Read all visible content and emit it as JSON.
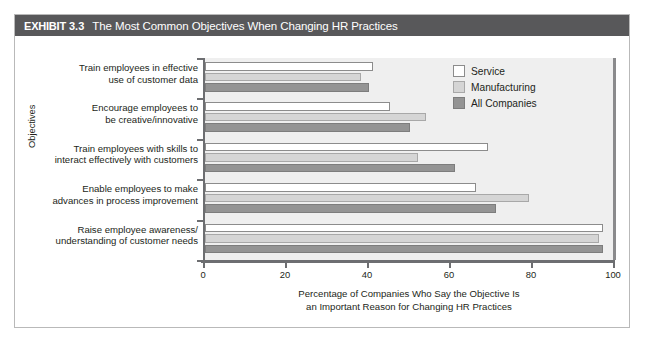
{
  "exhibit": {
    "label": "EXHIBIT",
    "number": "3.3",
    "title": "The Most Common Objectives When Changing HR Practices"
  },
  "chart_data": {
    "type": "bar",
    "orientation": "horizontal",
    "title": "The Most Common Objectives When Changing HR Practices",
    "xlabel": "Percentage of Companies Who Say the Objective Is an Important Reason for Changing HR Practices",
    "ylabel": "Objectives",
    "xlim": [
      0,
      100
    ],
    "xticks": [
      0,
      20,
      40,
      60,
      80,
      100
    ],
    "xtick_labels": [
      "0",
      "20",
      "40",
      "60",
      "80",
      "100"
    ],
    "grid": false,
    "legend_position": "top-right",
    "categories": [
      "Train employees in effective use of customer data",
      "Encourage employees to be creative/innovative",
      "Train employees with skills to interact effectively with customers",
      "Enable employees to make advances in process improvement",
      "Raise employee awareness/ understanding of customer needs"
    ],
    "category_lines": [
      [
        "Train employees in effective",
        "use of customer data"
      ],
      [
        "Encourage employees to",
        "be creative/innovative"
      ],
      [
        "Train employees with skills to",
        "interact effectively with customers"
      ],
      [
        "Enable employees to make",
        "advances in process improvement"
      ],
      [
        "Raise employee awareness/",
        "understanding of customer needs"
      ]
    ],
    "series": [
      {
        "name": "Service",
        "color": "#ffffff",
        "values": [
          41,
          45,
          69,
          66,
          97
        ]
      },
      {
        "name": "Manufacturing",
        "color": "#d5d5d5",
        "values": [
          38,
          54,
          52,
          79,
          96
        ]
      },
      {
        "name": "All Companies",
        "color": "#949494",
        "values": [
          40,
          50,
          61,
          71,
          97
        ]
      }
    ]
  },
  "legend": {
    "entries": [
      {
        "label": "Service",
        "swatch": "service"
      },
      {
        "label": "Manufacturing",
        "swatch": "manufacturing"
      },
      {
        "label": "All Companies",
        "swatch": "allcompanies"
      }
    ]
  },
  "axis_titles": {
    "x_line1": "Percentage of Companies Who Say the Objective Is",
    "x_line2": "an Important Reason for Changing HR Practices",
    "y": "Objectives"
  }
}
